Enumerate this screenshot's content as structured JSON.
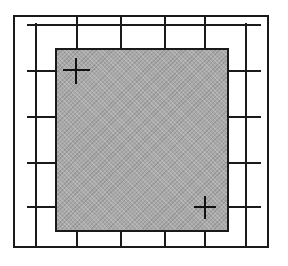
{
  "diagram": {
    "colors": {
      "line": "#1a1a1a",
      "panel_fill": "#a9a9a9",
      "background": "#ffffff"
    },
    "frame": {
      "x": 13,
      "y": 15,
      "w": 256,
      "h": 233
    },
    "grid": {
      "vertical_lines_x": [
        36,
        77,
        121,
        165,
        205,
        246
      ],
      "horizontal_lines_y": [
        24,
        70,
        116,
        162,
        206
      ]
    },
    "panel": {
      "x": 55,
      "y": 48,
      "w": 174,
      "h": 184
    },
    "markers": [
      {
        "name": "top-left-crosshair",
        "cx": 76,
        "cy": 70
      },
      {
        "name": "bottom-right-crosshair",
        "cx": 205,
        "cy": 207
      }
    ]
  }
}
